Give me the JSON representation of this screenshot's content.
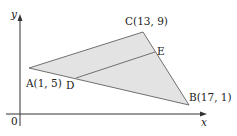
{
  "diagram": {
    "type": "coordinate-geometry-triangle",
    "axes": {
      "x_label": "x",
      "y_label": "y",
      "origin_label": "0"
    },
    "points": [
      {
        "name": "A",
        "label": "A(1, 5)",
        "x": 1,
        "y": 5
      },
      {
        "name": "B",
        "label": "B(17, 1)",
        "x": 17,
        "y": 1
      },
      {
        "name": "C",
        "label": "C(13, 9)",
        "x": 13,
        "y": 9
      },
      {
        "name": "D",
        "label": "D"
      },
      {
        "name": "E",
        "label": "E"
      }
    ],
    "segments": [
      "AB",
      "BC",
      "CA",
      "DE"
    ],
    "fill_color": "#e3e3e3",
    "line_color": "#707070",
    "axis_color": "#333333"
  }
}
